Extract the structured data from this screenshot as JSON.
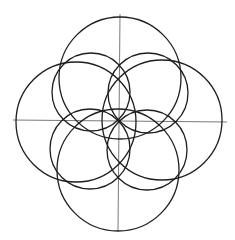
{
  "diagram": {
    "type": "geometric-construction",
    "colors": {
      "background": "#ffffff",
      "stroke": "#1e1e1e",
      "axis": "#6a6a6a"
    },
    "center": {
      "x": 119,
      "y": 121
    },
    "axes": {
      "horizontal": {
        "x1": 13,
        "y1": 120,
        "x2": 227,
        "y2": 122
      },
      "vertical": {
        "x1": 120,
        "y1": 14,
        "x2": 118,
        "y2": 231
      }
    },
    "outer_circles": [
      {
        "name": "top",
        "cx": 120,
        "cy": 78,
        "r": 61
      },
      {
        "name": "bottom",
        "cx": 118,
        "cy": 170,
        "r": 61
      },
      {
        "name": "left",
        "cx": 76,
        "cy": 122,
        "r": 60
      },
      {
        "name": "right",
        "cx": 162,
        "cy": 120,
        "r": 60
      }
    ],
    "inner_circles": [
      {
        "name": "top-left",
        "cx": 91,
        "cy": 92,
        "r": 39
      },
      {
        "name": "top-right",
        "cx": 148,
        "cy": 93,
        "r": 40
      },
      {
        "name": "bottom-left",
        "cx": 90,
        "cy": 149,
        "r": 40
      },
      {
        "name": "bottom-right",
        "cx": 147,
        "cy": 150,
        "r": 40
      }
    ]
  }
}
